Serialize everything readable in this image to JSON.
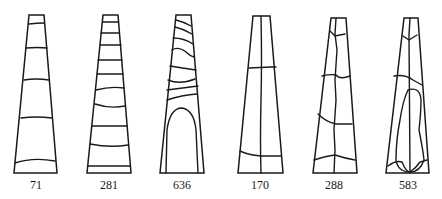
{
  "diagram": {
    "type": "series of tapered trapezoidal cross-sections with internal division lines",
    "figures": [
      {
        "id": "fig-1",
        "label": "71",
        "pattern": "horizontal bands (wide spacing)"
      },
      {
        "id": "fig-2",
        "label": "281",
        "pattern": "horizontal bands (close spacing)"
      },
      {
        "id": "fig-3",
        "label": "636",
        "pattern": "slanted bands over arch-shaped core"
      },
      {
        "id": "fig-4",
        "label": "170",
        "pattern": "vertical central line with two horizontal divisions"
      },
      {
        "id": "fig-5",
        "label": "288",
        "pattern": "irregular vertical central line with horizontal divisions"
      },
      {
        "id": "fig-6",
        "label": "583",
        "pattern": "vertical central line with elongated oval core"
      }
    ],
    "colors": {
      "stroke": "#1a1a1a",
      "background": "#ffffff"
    }
  }
}
